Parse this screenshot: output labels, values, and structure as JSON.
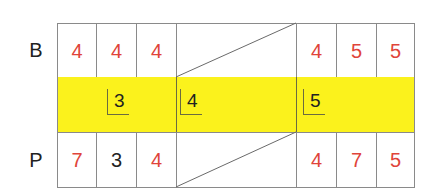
{
  "rows": {
    "top": {
      "label": "B",
      "left_cells": [
        {
          "value": "4",
          "color": "#e0443a"
        },
        {
          "value": "4",
          "color": "#e0443a"
        },
        {
          "value": "4",
          "color": "#e0443a"
        }
      ],
      "right_cells": [
        {
          "value": "4",
          "color": "#e0443a"
        },
        {
          "value": "5",
          "color": "#e0443a"
        },
        {
          "value": "5",
          "color": "#e0443a"
        }
      ]
    },
    "middle": {
      "background": "#fbf21c",
      "divisors": [
        "3",
        "4",
        "5"
      ]
    },
    "bottom": {
      "label": "P",
      "left_cells": [
        {
          "value": "7",
          "color": "#e0443a"
        },
        {
          "value": "3",
          "color": "#222222"
        },
        {
          "value": "4",
          "color": "#e0443a"
        }
      ],
      "right_cells": [
        {
          "value": "4",
          "color": "#e0443a"
        },
        {
          "value": "7",
          "color": "#e0443a"
        },
        {
          "value": "5",
          "color": "#e0443a"
        }
      ]
    }
  }
}
